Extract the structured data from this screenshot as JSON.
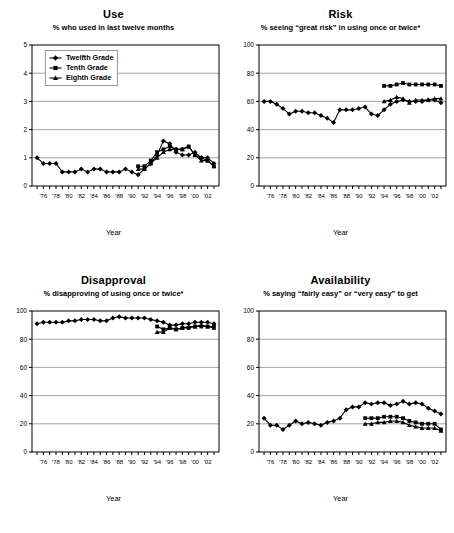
{
  "figure": {
    "x_axis_title": "Year",
    "x_tick_labels": [
      "'76",
      "'78",
      "'80",
      "'82",
      "'84",
      "'86",
      "'88",
      "'90",
      "'92",
      "'94",
      "'96",
      "'98",
      "'00",
      "'02"
    ],
    "legend": {
      "items": [
        {
          "label": "Twelfth Grade",
          "marker": "diamond-marker"
        },
        {
          "label": "Tenth Grade",
          "marker": "square-marker"
        },
        {
          "label": "Eighth Grade",
          "marker": "triangle-marker"
        }
      ]
    }
  },
  "chart_data": [
    {
      "type": "line",
      "title": "Use",
      "subtitle": "% who used in last twelve months",
      "xlabel": "Year",
      "ylabel": "",
      "ylim": [
        0,
        5
      ],
      "yticks": [
        0,
        1,
        2,
        3,
        4,
        5
      ],
      "grid": true,
      "legend_position": "top-left",
      "x": [
        1975,
        1976,
        1977,
        1978,
        1979,
        1980,
        1981,
        1982,
        1983,
        1984,
        1985,
        1986,
        1987,
        1988,
        1989,
        1990,
        1991,
        1992,
        1993,
        1994,
        1995,
        1996,
        1997,
        1998,
        1999,
        2000,
        2001,
        2002,
        2003
      ],
      "series": [
        {
          "name": "Twelfth Grade",
          "marker": "diamond-marker",
          "x": [
            1975,
            1976,
            1977,
            1978,
            1979,
            1980,
            1981,
            1982,
            1983,
            1984,
            1985,
            1986,
            1987,
            1988,
            1989,
            1990,
            1991,
            1992,
            1993,
            1994,
            1995,
            1996,
            1997,
            1998,
            1999,
            2000,
            2001,
            2002,
            2003
          ],
          "values": [
            1.0,
            0.8,
            0.8,
            0.8,
            0.5,
            0.5,
            0.5,
            0.6,
            0.5,
            0.6,
            0.6,
            0.5,
            0.5,
            0.5,
            0.6,
            0.5,
            0.4,
            0.6,
            0.8,
            1.1,
            1.6,
            1.5,
            1.2,
            1.1,
            1.1,
            1.2,
            1.0,
            1.0,
            0.8
          ]
        },
        {
          "name": "Tenth Grade",
          "marker": "square-marker",
          "x": [
            1991,
            1992,
            1993,
            1994,
            1995,
            1996,
            1997,
            1998,
            1999,
            2000,
            2001,
            2002,
            2003
          ],
          "values": [
            0.7,
            0.7,
            0.9,
            1.2,
            1.3,
            1.4,
            1.3,
            1.3,
            1.4,
            1.1,
            1.0,
            0.9,
            0.7
          ]
        },
        {
          "name": "Eighth Grade",
          "marker": "triangle-marker",
          "x": [
            1991,
            1992,
            1993,
            1994,
            1995,
            1996,
            1997,
            1998,
            1999,
            2000,
            2001,
            2002,
            2003
          ],
          "values": [
            0.6,
            0.6,
            0.8,
            1.0,
            1.2,
            1.3,
            1.3,
            1.3,
            1.4,
            1.1,
            0.9,
            0.9,
            0.7
          ]
        }
      ]
    },
    {
      "type": "line",
      "title": "Risk",
      "subtitle": "% seeing “great risk” in using once or twice*",
      "xlabel": "Year",
      "ylabel": "",
      "ylim": [
        0,
        100
      ],
      "yticks": [
        0,
        20,
        40,
        60,
        80,
        100
      ],
      "grid": true,
      "legend_position": "none",
      "series": [
        {
          "name": "Twelfth Grade",
          "marker": "diamond-marker",
          "x": [
            1975,
            1976,
            1977,
            1978,
            1979,
            1980,
            1981,
            1982,
            1983,
            1984,
            1985,
            1986,
            1987,
            1988,
            1989,
            1990,
            1991,
            1992,
            1993,
            1994,
            1995,
            1996,
            1997,
            1998,
            1999,
            2000,
            2001,
            2002,
            2003
          ],
          "values": [
            60,
            60,
            58,
            55,
            51,
            53,
            53,
            52,
            52,
            50,
            48,
            45,
            54,
            54,
            54,
            55,
            56,
            51,
            50,
            54,
            58,
            60,
            61,
            60,
            60,
            60,
            61,
            61,
            59
          ]
        },
        {
          "name": "Tenth Grade",
          "marker": "square-marker",
          "x": [
            1994,
            1995,
            1996,
            1997,
            1998,
            1999,
            2000,
            2001,
            2002,
            2003
          ],
          "values": [
            71,
            71,
            72,
            73,
            72,
            72,
            72,
            72,
            72,
            71
          ]
        },
        {
          "name": "Eighth Grade",
          "marker": "triangle-marker",
          "x": [
            1994,
            1995,
            1996,
            1997,
            1998,
            1999,
            2000,
            2001,
            2002,
            2003
          ],
          "values": [
            60,
            61,
            63,
            62,
            59,
            61,
            61,
            61,
            62,
            62
          ]
        }
      ]
    },
    {
      "type": "line",
      "title": "Disapproval",
      "subtitle": "% disapproving of using once or twice*",
      "xlabel": "Year",
      "ylabel": "",
      "ylim": [
        0,
        100
      ],
      "yticks": [
        0,
        20,
        40,
        60,
        80,
        100
      ],
      "grid": true,
      "legend_position": "none",
      "series": [
        {
          "name": "Twelfth Grade",
          "marker": "diamond-marker",
          "x": [
            1975,
            1976,
            1977,
            1978,
            1979,
            1980,
            1981,
            1982,
            1983,
            1984,
            1985,
            1986,
            1987,
            1988,
            1989,
            1990,
            1991,
            1992,
            1993,
            1994,
            1995,
            1996,
            1997,
            1998,
            1999,
            2000,
            2001,
            2002,
            2003
          ],
          "values": [
            91,
            92,
            92,
            92,
            92,
            93,
            93,
            94,
            94,
            94,
            93,
            93,
            95,
            96,
            95,
            95,
            95,
            95,
            94,
            93,
            92,
            90,
            90,
            91,
            91,
            92,
            92,
            92,
            91
          ]
        },
        {
          "name": "Tenth Grade",
          "marker": "square-marker",
          "x": [
            1994,
            1995,
            1996,
            1997,
            1998,
            1999,
            2000,
            2001,
            2002,
            2003
          ],
          "values": [
            89,
            87,
            88,
            87,
            88,
            88,
            89,
            89,
            89,
            89
          ]
        },
        {
          "name": "Eighth Grade",
          "marker": "triangle-marker",
          "x": [
            1994,
            1995,
            1996,
            1997,
            1998,
            1999,
            2000,
            2001,
            2002,
            2003
          ],
          "values": [
            85,
            85,
            88,
            87,
            88,
            89,
            89,
            90,
            89,
            88
          ]
        }
      ]
    },
    {
      "type": "line",
      "title": "Availability",
      "subtitle": "% saying “fairly easy” or “very easy” to get",
      "xlabel": "Year",
      "ylabel": "",
      "ylim": [
        0,
        100
      ],
      "yticks": [
        0,
        20,
        40,
        60,
        80,
        100
      ],
      "grid": true,
      "legend_position": "none",
      "series": [
        {
          "name": "Twelfth Grade",
          "marker": "diamond-marker",
          "x": [
            1975,
            1976,
            1977,
            1978,
            1979,
            1980,
            1981,
            1982,
            1983,
            1984,
            1985,
            1986,
            1987,
            1988,
            1989,
            1990,
            1991,
            1992,
            1993,
            1994,
            1995,
            1996,
            1997,
            1998,
            1999,
            2000,
            2001,
            2002,
            2003
          ],
          "values": [
            24,
            19,
            19,
            16,
            19,
            22,
            20,
            21,
            20,
            19,
            21,
            22,
            24,
            30,
            32,
            32,
            35,
            34,
            35,
            35,
            33,
            34,
            36,
            34,
            35,
            34,
            31,
            29,
            27
          ]
        },
        {
          "name": "Tenth Grade",
          "marker": "square-marker",
          "x": [
            1991,
            1992,
            1993,
            1994,
            1995,
            1996,
            1997,
            1998,
            1999,
            2000,
            2001,
            2002,
            2003
          ],
          "values": [
            24,
            24,
            24,
            25,
            25,
            25,
            24,
            22,
            21,
            20,
            20,
            20,
            16
          ]
        },
        {
          "name": "Eighth Grade",
          "marker": "triangle-marker",
          "x": [
            1991,
            1992,
            1993,
            1994,
            1995,
            1996,
            1997,
            1998,
            1999,
            2000,
            2001,
            2002,
            2003
          ],
          "values": [
            20,
            20,
            21,
            21,
            22,
            22,
            21,
            19,
            18,
            17,
            17,
            17,
            15
          ]
        }
      ]
    }
  ]
}
